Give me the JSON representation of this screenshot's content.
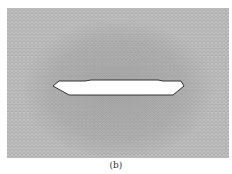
{
  "figure": {
    "caption": "(b)",
    "mesh": {
      "description": "triangular finite element mesh with refined region around central hole",
      "background_color": "#b8b8b8",
      "dense_color": "#a9a9a9",
      "region": {
        "x": 7,
        "y": 8,
        "width": 222,
        "height": 150
      }
    },
    "hole": {
      "fill": "#ffffff",
      "stroke": "#333333",
      "points": "53,86 59,81 85,81 91,80 158,80 163,81 181,81 184,86 173,95 69,95"
    }
  }
}
